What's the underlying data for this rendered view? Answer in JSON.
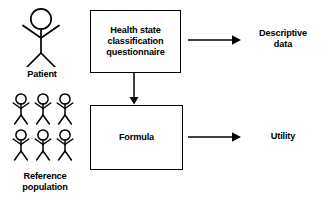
{
  "diagram": {
    "stroke_color": "#000000",
    "background_color": "#ffffff",
    "text_color": "#000000",
    "actors": [
      {
        "id": "patient",
        "caption": "Patient",
        "figure_icon": "stick-figure-person",
        "figure_count": 1,
        "size": "large"
      },
      {
        "id": "reference-population",
        "caption": "Reference\npopulation",
        "figure_icon": "stick-figure-group",
        "figure_count": 6,
        "rows": 2,
        "columns": 3,
        "size": "small"
      }
    ],
    "boxes": [
      {
        "id": "health-state-classification-questionnaire",
        "label": "Health state\nclassification\nquestionnaire"
      },
      {
        "id": "formula",
        "label": "Formula"
      }
    ],
    "outcomes": [
      {
        "id": "descriptive-data",
        "label": "Descriptive\ndata"
      },
      {
        "id": "utility",
        "label": "Utility"
      }
    ],
    "arrows": [
      {
        "id": "questionnaire-to-descriptive-data",
        "direction": "right",
        "from": "health-state-classification-questionnaire",
        "to": "descriptive-data"
      },
      {
        "id": "questionnaire-to-formula",
        "direction": "down",
        "from": "health-state-classification-questionnaire",
        "to": "formula"
      },
      {
        "id": "formula-to-utility",
        "direction": "right",
        "from": "formula",
        "to": "utility"
      }
    ]
  }
}
